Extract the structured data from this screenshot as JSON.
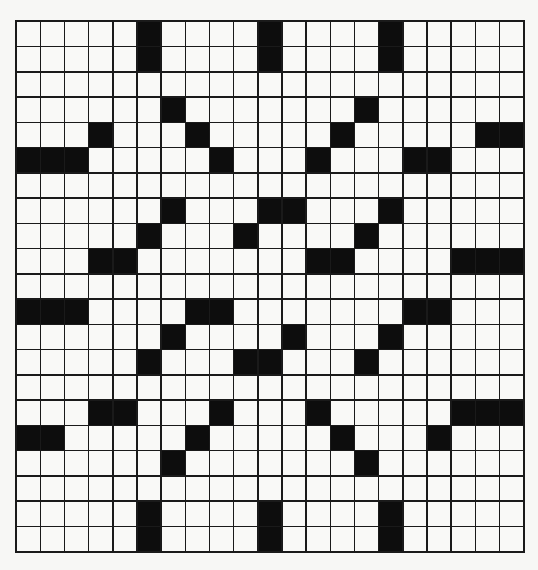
{
  "puzzle": {
    "rows": 21,
    "cols": 21,
    "colors": {
      "white": "#f9f9f7",
      "black": "#0d0d0d",
      "line": "#1a1a1a",
      "background": "#f7f7f5"
    },
    "black_cells_by_row": [
      [
        5,
        10,
        15
      ],
      [
        5,
        10,
        15
      ],
      [],
      [
        6,
        14
      ],
      [
        3,
        7,
        13,
        19,
        20
      ],
      [
        0,
        1,
        2,
        8,
        12,
        16,
        17
      ],
      [],
      [
        6,
        10,
        11,
        15
      ],
      [
        5,
        9,
        14
      ],
      [
        3,
        4,
        12,
        13,
        18,
        19,
        20
      ],
      [],
      [
        0,
        1,
        2,
        7,
        8,
        16,
        17
      ],
      [
        6,
        11,
        15
      ],
      [
        5,
        9,
        10,
        14
      ],
      [],
      [
        3,
        4,
        8,
        12,
        18,
        19,
        20
      ],
      [
        0,
        1,
        7,
        13,
        17
      ],
      [
        6,
        14
      ],
      [],
      [
        5,
        10,
        15
      ],
      [
        5,
        10,
        15
      ]
    ]
  }
}
